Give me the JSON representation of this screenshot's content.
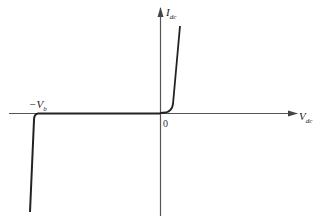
{
  "diagram": {
    "type": "diode-iv-characteristic",
    "labels": {
      "y_axis": "I",
      "y_axis_sub": "dc",
      "x_axis": "V",
      "x_axis_sub": "dc",
      "origin": "0",
      "breakdown": "−V",
      "breakdown_sub": "b"
    },
    "colors": {
      "axis": "#555555",
      "curve": "#222222",
      "background": "#ffffff"
    }
  }
}
